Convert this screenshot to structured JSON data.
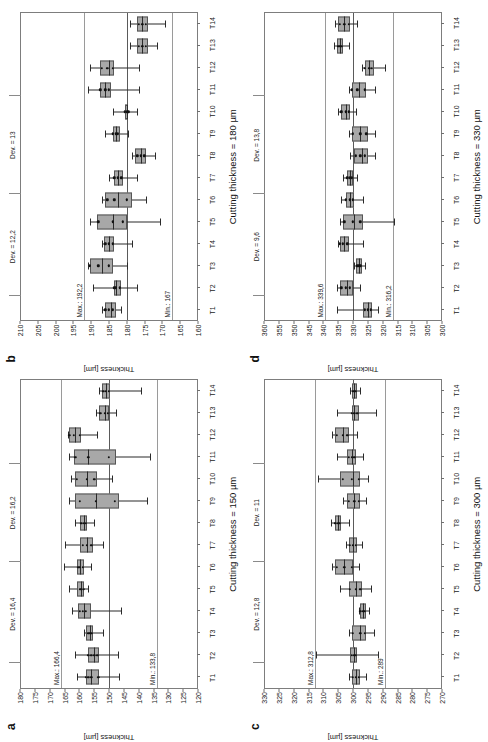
{
  "figure": {
    "panel_count": 4,
    "orientation_note": "rotated"
  },
  "chart_data": [
    {
      "type": "box",
      "panel": "a",
      "title": "Cutting thickness = 150 µm",
      "xlabel": "Cutting thickness = 150 µm",
      "ylabel": "Thickness [µm]",
      "ylim": [
        120,
        180
      ],
      "yticks": [
        180,
        175,
        170,
        165,
        160,
        155,
        150,
        145,
        140,
        135,
        130,
        125,
        120
      ],
      "grid": false,
      "legend": "none",
      "nominal": 150,
      "max_line": 166.4,
      "min_line": 133.8,
      "max_label": "Max.: 166,4",
      "min_label": "Min.: 133,8",
      "dev_upper_label": "Dev. = 16,4",
      "dev_lower_label": "Dev. = 16,2",
      "categories": [
        "T1",
        "T2",
        "T3",
        "T4",
        "T5",
        "T6",
        "T7",
        "T8",
        "T9",
        "T10",
        "T11",
        "T12",
        "T13",
        "T14"
      ],
      "boxes": [
        {
          "cat": "T1",
          "low": 146.5,
          "q1": 153.5,
          "med": 156.0,
          "q3": 158.0,
          "high": 161.0,
          "points": [
            156.0,
            157.0,
            153.6,
            158.0
          ]
        },
        {
          "cat": "T2",
          "low": 147.0,
          "q1": 153.5,
          "med": 155.0,
          "q3": 157.0,
          "high": 161.5,
          "points": [
            154.0,
            155.0,
            156.0,
            157.0
          ]
        },
        {
          "cat": "T3",
          "low": 152.0,
          "q1": 155.5,
          "med": 156.5,
          "q3": 158.0,
          "high": 158.5,
          "points": [
            156.0,
            156.5,
            157.0
          ]
        },
        {
          "cat": "T4",
          "low": 146.0,
          "q1": 156.0,
          "med": 158.5,
          "q3": 160.5,
          "high": 162.5,
          "points": [
            158.0,
            159.0,
            160.0
          ]
        },
        {
          "cat": "T5",
          "low": 157.0,
          "q1": 158.5,
          "med": 159.5,
          "q3": 161.0,
          "high": 163.5,
          "points": [
            158.5,
            159.5,
            160.0
          ]
        },
        {
          "cat": "T6",
          "low": 156.0,
          "q1": 158.5,
          "med": 160.0,
          "q3": 161.0,
          "high": 165.5,
          "points": [
            159.0,
            160.0,
            160.5
          ]
        },
        {
          "cat": "T7",
          "low": 152.0,
          "q1": 155.5,
          "med": 157.5,
          "q3": 160.0,
          "high": 165.0,
          "points": [
            156.0,
            157.5,
            159.0
          ]
        },
        {
          "cat": "T8",
          "low": 155.0,
          "q1": 157.5,
          "med": 158.5,
          "q3": 160.0,
          "high": 161.5,
          "points": [
            158.0,
            158.5,
            159.5
          ]
        },
        {
          "cat": "T9",
          "low": 137.0,
          "q1": 146.5,
          "med": 154.5,
          "q3": 161.5,
          "high": 163.5,
          "points": [
            148.0,
            154.5,
            160.0
          ]
        },
        {
          "cat": "T10",
          "low": 149.0,
          "q1": 154.0,
          "med": 157.5,
          "q3": 161.5,
          "high": 163.0,
          "points": [
            155.0,
            157.5,
            161.0
          ]
        },
        {
          "cat": "T11",
          "low": 136.0,
          "q1": 147.5,
          "med": 157.0,
          "q3": 162.0,
          "high": 163.5,
          "points": [
            150.0,
            157.0,
            161.5
          ]
        },
        {
          "cat": "T12",
          "low": 154.0,
          "q1": 159.5,
          "med": 161.5,
          "q3": 163.5,
          "high": 164.0,
          "points": [
            160.0,
            162.0,
            163.5
          ]
        },
        {
          "cat": "T13",
          "low": 147.5,
          "q1": 150.0,
          "med": 151.5,
          "q3": 153.5,
          "high": 154.5,
          "points": [
            150.5,
            151.5,
            153.0
          ]
        },
        {
          "cat": "T14",
          "low": 139.0,
          "q1": 149.5,
          "med": 151.0,
          "q3": 152.5,
          "high": 153.5,
          "points": [
            150.0,
            151.0,
            152.0
          ]
        }
      ]
    },
    {
      "type": "box",
      "panel": "b",
      "title": "Cutting thickness = 180 µm",
      "xlabel": "Cutting thickness = 180 µm",
      "ylabel": "Thickness [µm]",
      "ylim": [
        160,
        210
      ],
      "yticks": [
        210,
        205,
        200,
        195,
        190,
        185,
        180,
        175,
        170,
        165,
        160
      ],
      "grid": false,
      "legend": "none",
      "nominal": 180,
      "max_line": 192.2,
      "min_line": 167,
      "max_label": "Max.: 192,2",
      "min_label": "Min.: 167",
      "dev_upper_label": "Dev. = 12,2",
      "dev_lower_label": "Dev. = 13",
      "categories": [
        "T1",
        "T2",
        "T3",
        "T4",
        "T5",
        "T6",
        "T7",
        "T8",
        "T9",
        "T10",
        "T11",
        "T12",
        "T13",
        "T14"
      ],
      "boxes": [
        {
          "cat": "T1",
          "low": 181.5,
          "q1": 183.0,
          "med": 184.5,
          "q3": 186.0,
          "high": 187.0,
          "points": [
            184.0,
            185.0,
            186.0
          ]
        },
        {
          "cat": "T2",
          "low": 177.0,
          "q1": 181.5,
          "med": 183.0,
          "q3": 183.5,
          "high": 189.5,
          "points": [
            182.0,
            183.0,
            183.5
          ]
        },
        {
          "cat": "T3",
          "low": 180.0,
          "q1": 184.0,
          "med": 187.0,
          "q3": 190.5,
          "high": 191.0,
          "points": [
            185.0,
            188.0,
            190.5
          ]
        },
        {
          "cat": "T4",
          "low": 178.5,
          "q1": 183.5,
          "med": 185.0,
          "q3": 186.5,
          "high": 187.0,
          "points": [
            184.0,
            185.0,
            186.0
          ]
        },
        {
          "cat": "T5",
          "low": 170.5,
          "q1": 180.0,
          "med": 184.0,
          "q3": 188.5,
          "high": 190.5,
          "points": [
            181.0,
            184.0,
            188.0
          ]
        },
        {
          "cat": "T6",
          "low": 174.5,
          "q1": 178.5,
          "med": 182.5,
          "q3": 186.0,
          "high": 187.0,
          "points": [
            180.0,
            183.5,
            185.5
          ]
        },
        {
          "cat": "T7",
          "low": 177.0,
          "q1": 181.0,
          "med": 182.5,
          "q3": 183.5,
          "high": 185.0,
          "points": [
            181.5,
            182.5,
            183.5
          ]
        },
        {
          "cat": "T8",
          "low": 172.0,
          "q1": 174.5,
          "med": 176.0,
          "q3": 177.5,
          "high": 178.5,
          "points": [
            175.0,
            176.0,
            177.0
          ]
        },
        {
          "cat": "T9",
          "low": 179.5,
          "q1": 182.0,
          "med": 183.0,
          "q3": 184.0,
          "high": 186.0,
          "points": [
            182.5,
            183.0,
            184.0
          ]
        },
        {
          "cat": "T10",
          "low": 177.0,
          "q1": 179.5,
          "med": 180.0,
          "q3": 180.5,
          "high": 184.0,
          "points": [
            179.5,
            180.0,
            180.5
          ]
        },
        {
          "cat": "T11",
          "low": 176.5,
          "q1": 184.5,
          "med": 186.0,
          "q3": 187.5,
          "high": 191.0,
          "points": [
            185.0,
            186.0,
            187.5
          ]
        },
        {
          "cat": "T12",
          "low": 176.5,
          "q1": 183.5,
          "med": 185.0,
          "q3": 187.5,
          "high": 190.5,
          "points": [
            184.0,
            185.5,
            187.0
          ]
        },
        {
          "cat": "T13",
          "low": 171.5,
          "q1": 174.0,
          "med": 175.5,
          "q3": 177.0,
          "high": 179.0,
          "points": [
            174.5,
            175.5,
            176.5
          ]
        },
        {
          "cat": "T14",
          "low": 169.0,
          "q1": 174.0,
          "med": 175.5,
          "q3": 177.0,
          "high": 179.0,
          "points": [
            174.5,
            175.5,
            176.5
          ]
        }
      ]
    },
    {
      "type": "box",
      "panel": "c",
      "title": "Cutting thickness = 300 µm",
      "xlabel": "Cutting thickness = 300 µm",
      "ylabel": "Thickness [µm]",
      "ylim": [
        270,
        330
      ],
      "yticks": [
        330,
        325,
        320,
        315,
        310,
        305,
        300,
        295,
        290,
        285,
        280,
        275,
        270
      ],
      "grid": false,
      "legend": "none",
      "nominal": 300,
      "max_line": 312.8,
      "min_line": 289,
      "max_label": "Max.: 312,8",
      "min_label": "Min.: 289",
      "dev_upper_label": "Dev. = 12,8",
      "dev_lower_label": "Dev. = 11",
      "categories": [
        "T1",
        "T2",
        "T3",
        "T4",
        "T5",
        "T6",
        "T7",
        "T8",
        "T9",
        "T10",
        "T11",
        "T12",
        "T13",
        "T14"
      ],
      "boxes": [
        {
          "cat": "T1",
          "low": 295.5,
          "q1": 297.5,
          "med": 299.0,
          "q3": 300.5,
          "high": 301.5,
          "points": [
            298.0,
            299.0,
            300.0
          ]
        },
        {
          "cat": "T2",
          "low": 291.5,
          "q1": 298.5,
          "med": 299.5,
          "q3": 301.0,
          "high": 312.5,
          "points": [
            299.0,
            299.5,
            300.5
          ]
        },
        {
          "cat": "T3",
          "low": 293.0,
          "q1": 295.5,
          "med": 297.5,
          "q3": 300.5,
          "high": 301.5,
          "points": [
            296.0,
            297.5,
            300.0
          ]
        },
        {
          "cat": "T4",
          "low": 294.5,
          "q1": 295.5,
          "med": 296.5,
          "q3": 297.5,
          "high": 298.0,
          "points": [
            296.0,
            296.5,
            297.5
          ]
        },
        {
          "cat": "T5",
          "low": 294.0,
          "q1": 297.0,
          "med": 299.0,
          "q3": 301.5,
          "high": 304.5,
          "points": [
            297.5,
            299.0,
            301.0
          ]
        },
        {
          "cat": "T6",
          "low": 298.0,
          "q1": 300.0,
          "med": 303.0,
          "q3": 306.0,
          "high": 307.0,
          "points": [
            300.5,
            303.0,
            305.5
          ]
        },
        {
          "cat": "T7",
          "low": 297.0,
          "q1": 298.5,
          "med": 300.0,
          "q3": 301.5,
          "high": 302.5,
          "points": [
            299.0,
            300.0,
            301.0
          ]
        },
        {
          "cat": "T8",
          "low": 301.5,
          "q1": 304.0,
          "med": 305.0,
          "q3": 306.0,
          "high": 307.5,
          "points": [
            304.5,
            305.0,
            306.0
          ]
        },
        {
          "cat": "T9",
          "low": 295.5,
          "q1": 297.5,
          "med": 299.5,
          "q3": 302.0,
          "high": 303.5,
          "points": [
            298.0,
            299.5,
            301.5
          ]
        },
        {
          "cat": "T10",
          "low": 295.0,
          "q1": 297.5,
          "med": 300.0,
          "q3": 304.5,
          "high": 312.0,
          "points": [
            298.0,
            300.5,
            303.5
          ]
        },
        {
          "cat": "T11",
          "low": 296.5,
          "q1": 299.0,
          "med": 300.5,
          "q3": 302.0,
          "high": 305.5,
          "points": [
            299.5,
            300.5,
            301.5
          ]
        },
        {
          "cat": "T12",
          "low": 298.5,
          "q1": 301.5,
          "med": 303.5,
          "q3": 306.0,
          "high": 307.0,
          "points": [
            302.0,
            303.5,
            305.5
          ]
        },
        {
          "cat": "T13",
          "low": 292.0,
          "q1": 298.0,
          "med": 299.5,
          "q3": 300.5,
          "high": 305.5,
          "points": [
            298.5,
            299.5,
            300.5
          ]
        },
        {
          "cat": "T14",
          "low": 297.5,
          "q1": 298.5,
          "med": 299.5,
          "q3": 300.5,
          "high": 301.0,
          "points": [
            299.0,
            299.5,
            300.0
          ]
        }
      ]
    },
    {
      "type": "box",
      "panel": "d",
      "title": "Cutting thickness = 330 µm",
      "xlabel": "Cutting thickness = 330 µm",
      "ylabel": "Thickness [µm]",
      "ylim": [
        300,
        360
      ],
      "yticks": [
        360,
        355,
        350,
        345,
        340,
        335,
        330,
        325,
        320,
        315,
        310,
        305,
        300
      ],
      "grid": false,
      "legend": "none",
      "nominal": 330,
      "max_line": 339.6,
      "min_line": 316.2,
      "max_label": "Max.: 339,6",
      "min_label": "Min.: 316,2",
      "dev_upper_label": "Dev. = 9,6",
      "dev_lower_label": "Dev. = 13,8",
      "categories": [
        "T1",
        "T2",
        "T3",
        "T4",
        "T5",
        "T6",
        "T7",
        "T8",
        "T9",
        "T10",
        "T11",
        "T12",
        "T13",
        "T14"
      ],
      "boxes": [
        {
          "cat": "T1",
          "low": 321.5,
          "q1": 323.5,
          "med": 325.0,
          "q3": 326.5,
          "high": 335.5,
          "points": [
            324.0,
            325.0,
            326.0
          ]
        },
        {
          "cat": "T2",
          "low": 327.5,
          "q1": 330.0,
          "med": 332.0,
          "q3": 334.5,
          "high": 335.5,
          "points": [
            331.0,
            332.5,
            334.0
          ]
        },
        {
          "cat": "T3",
          "low": 326.0,
          "q1": 327.0,
          "med": 328.0,
          "q3": 329.0,
          "high": 329.5,
          "points": [
            327.5,
            328.0,
            328.5
          ]
        },
        {
          "cat": "T4",
          "low": 326.5,
          "q1": 331.5,
          "med": 333.0,
          "q3": 334.5,
          "high": 335.0,
          "points": [
            332.0,
            333.5,
            334.5
          ]
        },
        {
          "cat": "T5",
          "low": 316.0,
          "q1": 326.5,
          "med": 329.5,
          "q3": 333.5,
          "high": 334.5,
          "points": [
            327.5,
            330.0,
            333.0
          ]
        },
        {
          "cat": "T6",
          "low": 326.5,
          "q1": 329.5,
          "med": 331.0,
          "q3": 332.5,
          "high": 334.0,
          "points": [
            330.0,
            331.0,
            332.5
          ]
        },
        {
          "cat": "T7",
          "low": 328.5,
          "q1": 330.0,
          "med": 331.0,
          "q3": 332.0,
          "high": 333.5,
          "points": [
            330.5,
            331.0,
            332.0
          ]
        },
        {
          "cat": "T8",
          "low": 322.5,
          "q1": 325.0,
          "med": 327.0,
          "q3": 329.5,
          "high": 331.0,
          "points": [
            326.0,
            327.5,
            329.0
          ]
        },
        {
          "cat": "T9",
          "low": 322.5,
          "q1": 325.0,
          "med": 327.5,
          "q3": 330.5,
          "high": 331.5,
          "points": [
            325.5,
            327.5,
            330.0
          ]
        },
        {
          "cat": "T10",
          "low": 329.0,
          "q1": 331.0,
          "med": 332.5,
          "q3": 334.0,
          "high": 335.0,
          "points": [
            331.5,
            332.5,
            334.0
          ]
        },
        {
          "cat": "T11",
          "low": 322.5,
          "q1": 325.5,
          "med": 328.0,
          "q3": 330.5,
          "high": 331.5,
          "points": [
            326.0,
            328.5,
            330.5
          ]
        },
        {
          "cat": "T12",
          "low": 319.0,
          "q1": 323.0,
          "med": 324.5,
          "q3": 326.0,
          "high": 327.0,
          "points": [
            323.5,
            324.5,
            326.0
          ]
        },
        {
          "cat": "T13",
          "low": 331.5,
          "q1": 333.5,
          "med": 334.5,
          "q3": 335.5,
          "high": 336.5,
          "points": [
            334.0,
            334.5,
            335.0
          ]
        },
        {
          "cat": "T14",
          "low": 328.5,
          "q1": 331.0,
          "med": 333.0,
          "q3": 335.0,
          "high": 336.0,
          "points": [
            331.5,
            333.0,
            334.5
          ]
        }
      ]
    }
  ]
}
